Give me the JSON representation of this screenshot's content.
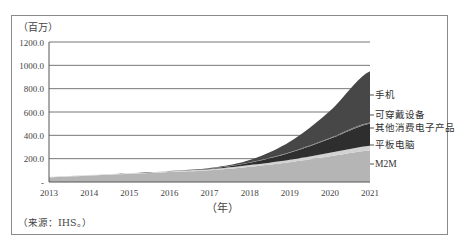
{
  "chart_data": {
    "type": "area",
    "stacked": true,
    "title": "",
    "unit_label": "（百万）",
    "xlabel": "（年）",
    "ylabel": "百万",
    "ylim": [
      0,
      1200
    ],
    "yticks": [
      "-",
      "200.0",
      "400.0",
      "600.0",
      "800.0",
      "1000.0",
      "1200.0"
    ],
    "x": [
      "2013",
      "2014",
      "2015",
      "2016",
      "2017",
      "2018",
      "2019",
      "2020",
      "2021"
    ],
    "grid": true,
    "legend_position": "right (inline labels)",
    "series": [
      {
        "name": "M2M",
        "color": "#b5b5b5",
        "values": [
          40,
          55,
          70,
          85,
          100,
          130,
          170,
          220,
          270
        ]
      },
      {
        "name": "平板电脑",
        "color": "#d2d2d2",
        "values": [
          5,
          5,
          5,
          8,
          10,
          15,
          20,
          30,
          40
        ]
      },
      {
        "name": "其他消费电子产品",
        "color": "#2e2e2e",
        "values": [
          0,
          0,
          0,
          2,
          5,
          20,
          60,
          120,
          190
        ]
      },
      {
        "name": "可穿戴设备",
        "color": "#7a7a7a",
        "values": [
          0,
          0,
          0,
          0,
          1,
          3,
          5,
          8,
          10
        ]
      },
      {
        "name": "手机",
        "color": "#474747",
        "values": [
          0,
          0,
          0,
          0,
          4,
          20,
          90,
          230,
          440
        ]
      }
    ],
    "source": "（来源：IHS。）"
  }
}
